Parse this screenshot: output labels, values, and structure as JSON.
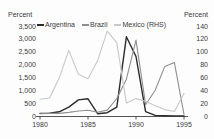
{
  "title": "Inflation Rates",
  "axes": {
    "left_unit_label": "Percent",
    "right_unit_label": "Percent"
  },
  "legend": {
    "items": [
      {
        "label": "Argentina",
        "color": "#2b2b2b"
      },
      {
        "label": "Brazil",
        "color": "#8f8f8f"
      },
      {
        "label": "Mexico (RHS)",
        "color": "#c8c8c8"
      }
    ]
  },
  "chart_data": {
    "type": "line",
    "title": "Inflation Rates",
    "x": [
      1980,
      1981,
      1982,
      1983,
      1984,
      1985,
      1986,
      1987,
      1988,
      1989,
      1990,
      1991,
      1992,
      1993,
      1994,
      1995
    ],
    "x_tick_labels": [
      "1980",
      "1985",
      "1990",
      "1995"
    ],
    "y_left": {
      "label": "Percent",
      "range": [
        0,
        3500
      ],
      "tick_labels": [
        "0",
        "500",
        "1,000",
        "1,500",
        "2,000",
        "2,500",
        "3,000",
        "3,500"
      ]
    },
    "y_right": {
      "label": "Percent",
      "range": [
        0,
        140
      ],
      "tick_labels": [
        "0",
        "20",
        "40",
        "60",
        "80",
        "100",
        "120",
        "140"
      ]
    },
    "grid": false,
    "legend_position": "top-inside",
    "series": [
      {
        "name": "Argentina",
        "axis": "left",
        "color": "#2b2b2b",
        "width": 1.4,
        "values": [
          100,
          105,
          165,
          345,
          625,
          670,
          90,
          130,
          345,
          3080,
          2315,
          170,
          25,
          10,
          4,
          3
        ]
      },
      {
        "name": "Brazil",
        "axis": "left",
        "color": "#8f8f8f",
        "width": 1.1,
        "values": [
          90,
          100,
          100,
          140,
          195,
          225,
          145,
          230,
          680,
          1430,
          2950,
          440,
          1000,
          1930,
          2075,
          66
        ]
      },
      {
        "name": "Mexico (RHS)",
        "axis": "right",
        "color": "#c8c8c8",
        "width": 1.1,
        "values": [
          26,
          28,
          59,
          102,
          65,
          58,
          86,
          132,
          114,
          20,
          27,
          23,
          16,
          10,
          7,
          35
        ]
      }
    ]
  }
}
